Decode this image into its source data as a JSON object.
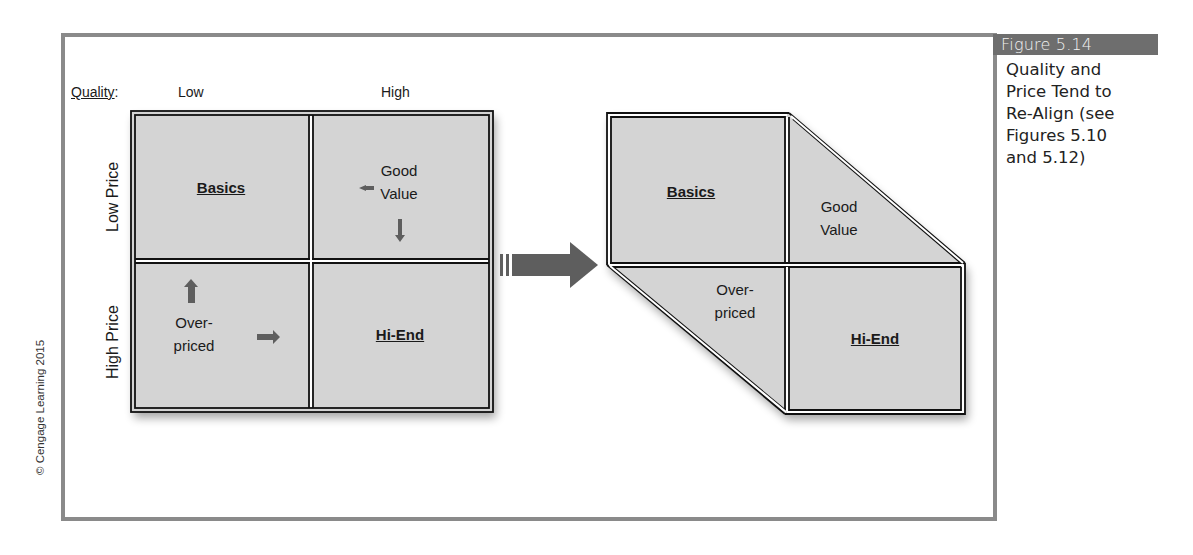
{
  "figure": {
    "number_label": "Figure 5.14",
    "caption": "Quality and Price Tend to Re-Align (see Figures 5.10 and 5.12)",
    "caption_lines": [
      "Quality and",
      "Price Tend to",
      "Re-Align (see",
      "Figures 5.10",
      "and 5.12)"
    ],
    "credit": "© Cengage Learning 2015"
  },
  "axes": {
    "quality_label": "Quality",
    "quality_suffix": ":",
    "quality_low": "Low",
    "quality_high": "High",
    "price_low": "Low Price",
    "price_high": "High Price"
  },
  "left_matrix": {
    "cells": {
      "top_left": {
        "title": "Basics"
      },
      "top_right": {
        "line1": "Good",
        "line2": "Value",
        "arrows": [
          "left-arrow",
          "down-arrow"
        ]
      },
      "bottom_left": {
        "line1": "Over-",
        "line2": "priced",
        "arrows": [
          "up-arrow",
          "right-arrow"
        ]
      },
      "bottom_right": {
        "title": "Hi-End"
      }
    }
  },
  "transition_arrow": {
    "direction": "right"
  },
  "right_matrix": {
    "cells": {
      "top_left": {
        "title": "Basics"
      },
      "top_right": {
        "line1": "Good",
        "line2": "Value"
      },
      "bottom_left": {
        "line1": "Over-",
        "line2": "priced"
      },
      "bottom_right": {
        "title": "Hi-End"
      }
    }
  },
  "colors": {
    "cell_fill": "#d4d4d4",
    "border": "#111111",
    "arrow": "#5e5e5e",
    "frame": "#8a8a8a",
    "caption_tab": "#6e6e6e"
  }
}
